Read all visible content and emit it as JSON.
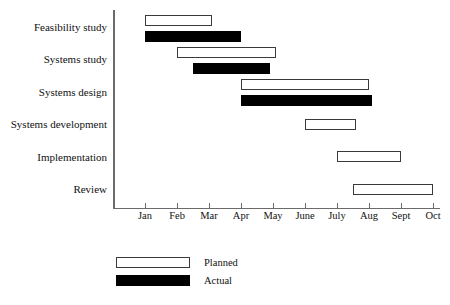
{
  "chart_data": {
    "type": "bar",
    "subtype": "gantt",
    "title": "",
    "xlabel": "",
    "ylabel": "",
    "grid": false,
    "legend_position": "bottom-left",
    "x_tick_labels": [
      "Jan",
      "Feb",
      "Mar",
      "Apr",
      "May",
      "June",
      "July",
      "Aug",
      "Sept",
      "Oct"
    ],
    "x_tick_values": [
      1,
      2,
      3,
      4,
      5,
      6,
      7,
      8,
      9,
      10
    ],
    "xlim": [
      0.5,
      10.5
    ],
    "categories": [
      "Feasibility study",
      "Systems study",
      "Systems design",
      "Systems development",
      "Implementation",
      "Review"
    ],
    "series": [
      {
        "name": "Planned",
        "color": "#ffffff",
        "bars": [
          {
            "task": "Feasibility study",
            "start": 1.0,
            "end": 3.1
          },
          {
            "task": "Systems study",
            "start": 2.0,
            "end": 5.1
          },
          {
            "task": "Systems design",
            "start": 4.0,
            "end": 8.0
          },
          {
            "task": "Systems development",
            "start": 6.0,
            "end": 7.6
          },
          {
            "task": "Implementation",
            "start": 7.0,
            "end": 9.0
          },
          {
            "task": "Review",
            "start": 7.5,
            "end": 10.0
          }
        ]
      },
      {
        "name": "Actual",
        "color": "#000000",
        "bars": [
          {
            "task": "Feasibility study",
            "start": 1.0,
            "end": 4.0
          },
          {
            "task": "Systems study",
            "start": 2.5,
            "end": 4.9
          },
          {
            "task": "Systems design",
            "start": 4.0,
            "end": 8.1
          }
        ]
      }
    ]
  },
  "legend": {
    "items": [
      {
        "label": "Planned",
        "swatch": "planned"
      },
      {
        "label": "Actual",
        "swatch": "actual"
      }
    ]
  },
  "caption": {
    "text": ""
  }
}
